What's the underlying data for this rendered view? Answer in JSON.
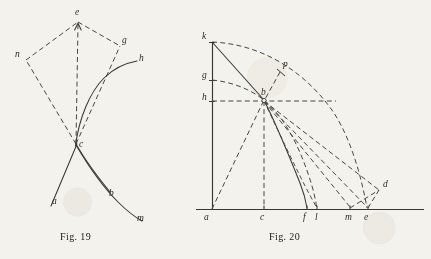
{
  "page": {
    "background_color": "#f4f2ed",
    "ink_color": "#3a3632",
    "width": 431,
    "height": 259
  },
  "figures": [
    {
      "id": "fig19",
      "caption": "Fig. 19",
      "caption_pos": {
        "x": 78,
        "y": 234
      },
      "labels": [
        {
          "text": "e",
          "x": 77,
          "y": 12
        },
        {
          "text": "g",
          "x": 124,
          "y": 40
        },
        {
          "text": "n",
          "x": 17,
          "y": 54
        },
        {
          "text": "h",
          "x": 141,
          "y": 58
        },
        {
          "text": "c",
          "x": 80,
          "y": 139
        },
        {
          "text": "a",
          "x": 54,
          "y": 196
        },
        {
          "text": "b",
          "x": 111,
          "y": 188
        },
        {
          "text": "m",
          "x": 139,
          "y": 213
        }
      ],
      "points": {
        "e": [
          78,
          22
        ],
        "g": [
          120,
          46
        ],
        "n": [
          26,
          60
        ],
        "c": [
          76,
          144
        ],
        "h": [
          136,
          62
        ],
        "a": [
          52,
          204
        ],
        "b": [
          110,
          197
        ],
        "m": [
          141,
          222
        ]
      }
    },
    {
      "id": "fig20",
      "caption": "Fig. 20",
      "caption_pos": {
        "x": 287,
        "y": 234
      },
      "labels": [
        {
          "text": "k",
          "x": 204,
          "y": 36
        },
        {
          "text": "p",
          "x": 284,
          "y": 65
        },
        {
          "text": "g",
          "x": 204,
          "y": 74
        },
        {
          "text": "h",
          "x": 204,
          "y": 96
        },
        {
          "text": "b",
          "x": 263,
          "y": 93
        },
        {
          "text": "d",
          "x": 384,
          "y": 184
        },
        {
          "text": "a",
          "x": 205,
          "y": 216
        },
        {
          "text": "c",
          "x": 260,
          "y": 216
        },
        {
          "text": "f",
          "x": 303,
          "y": 216
        },
        {
          "text": "l",
          "x": 314,
          "y": 216
        },
        {
          "text": "m",
          "x": 346,
          "y": 216
        },
        {
          "text": "e",
          "x": 364,
          "y": 216
        }
      ],
      "points": {
        "a": [
          212,
          209
        ],
        "k": [
          212,
          42
        ],
        "g": [
          212,
          80
        ],
        "h": [
          212,
          101
        ],
        "b": [
          264,
          100
        ],
        "c": [
          264,
          209
        ],
        "f": [
          307,
          209
        ],
        "l": [
          317,
          209
        ],
        "m": [
          350,
          209
        ],
        "e": [
          368,
          209
        ],
        "d": [
          379,
          190
        ],
        "p": [
          280,
          72
        ]
      },
      "baseline": {
        "x1": 196,
        "x2": 424,
        "y": 209
      }
    }
  ],
  "elements": {
    "fig19_solid_curve_c_h": "curve from c rising to h",
    "fig19_solid_curve_c_m": "curve from c descending to m",
    "fig19_solid_line_a_c": "straight line a to c",
    "fig19_solid_line_c_b": "line c to b",
    "fig19_dashed_c_e": "dashed line c to e",
    "fig19_dashed_c_n": "dashed line c to n",
    "fig19_dashed_c_g": "dashed line c to g",
    "fig19_dashed_n_e": "dashed edge n to e",
    "fig19_dashed_e_g": "dashed edge e to g",
    "fig20_axis_vertical_a_k": "vertical axis a to k",
    "fig20_axis_horizontal": "horizontal baseline through a c f l m e",
    "fig20_chord_k_b": "solid chord from k through b",
    "fig20_curve_b_f": "solid curve b to f",
    "fig20_arc_k_e": "large dashed arc k to e",
    "fig20_arc_g_b": "dashed arc g through b",
    "fig20_arc_h_b": "dashed horizontal h to b extended",
    "fig20_dashed_a_b": "dashed line a to b",
    "fig20_dashed_b_c": "dashed vertical b to c",
    "fig20_dashed_b_d": "dashed ray b to d",
    "fig20_dashed_b_e": "dashed ray b to e",
    "fig20_dashed_b_m": "dashed ray b to m",
    "fig20_dashed_b_l": "dashed curve b to l",
    "fig20_dashed_p_b": "dashed line p to b",
    "fig20_dashed_m_d": "dashed line m to d",
    "fig20_dashed_e_d": "dashed line e to d"
  }
}
